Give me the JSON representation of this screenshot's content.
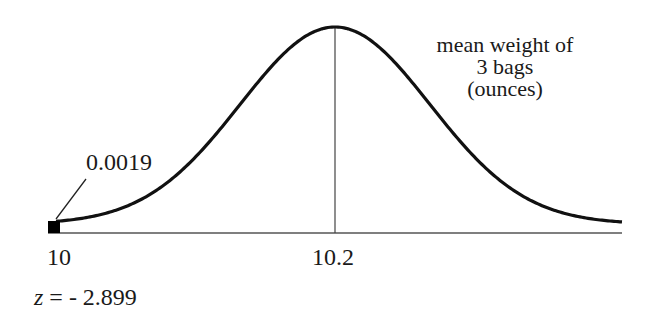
{
  "chart_data": {
    "type": "area",
    "title": "",
    "distribution": "normal",
    "mean": 10.2,
    "x_ticks": [
      "10",
      "10.2"
    ],
    "xlabel": "mean weight of 3 bags (ounces)",
    "shaded_region": {
      "from": "left tail",
      "to": 10,
      "probability": 0.0019
    },
    "z_score": -2.899,
    "annotations": [
      "0.0019",
      "z = - 2.899"
    ]
  },
  "labels": {
    "tail_prob": "0.0019",
    "tick_left": "10",
    "tick_center": "10.2",
    "z_prefix": "z",
    "z_value": " = - 2.899",
    "axis_line1": "mean weight of",
    "axis_line2": "3 bags",
    "axis_line3": "(ounces)"
  }
}
